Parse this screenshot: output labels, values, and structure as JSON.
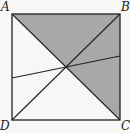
{
  "diagram": {
    "type": "geometry",
    "shape": "square",
    "labels": {
      "A": "A",
      "B": "B",
      "C": "C",
      "D": "D"
    },
    "vertices": {
      "A": [
        12,
        14
      ],
      "B": [
        120,
        14
      ],
      "C": [
        120,
        120
      ],
      "D": [
        12,
        120
      ]
    },
    "center": [
      66,
      67
    ],
    "transversal": {
      "left": [
        12,
        78
      ],
      "right": [
        120,
        56
      ]
    },
    "shaded_regions": [
      "triangle ABO",
      "triangle BCO"
    ],
    "colors": {
      "shade": "#a8a8a8",
      "line": "#222222",
      "background": "#f7f7f5"
    }
  }
}
